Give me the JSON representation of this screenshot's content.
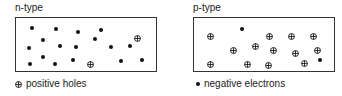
{
  "panels": [
    {
      "title": "n-type",
      "box": {
        "x": 15,
        "y": 17,
        "w": 142,
        "h": 55
      },
      "electrons": [
        [
          32,
          28
        ],
        [
          56,
          29
        ],
        [
          78,
          32
        ],
        [
          101,
          30
        ],
        [
          43,
          40
        ],
        [
          95,
          39
        ],
        [
          29,
          48
        ],
        [
          60,
          46
        ],
        [
          76,
          47
        ],
        [
          111,
          47
        ],
        [
          130,
          46
        ],
        [
          43,
          57
        ],
        [
          30,
          64
        ],
        [
          55,
          64
        ],
        [
          73,
          60
        ],
        [
          121,
          61
        ],
        [
          142,
          60
        ]
      ],
      "holes": [
        [
          137,
          31
        ],
        [
          90,
          57
        ]
      ]
    },
    {
      "title": "p-type",
      "box": {
        "x": 193,
        "y": 17,
        "w": 142,
        "h": 55
      },
      "electrons": [
        [
          242,
          29
        ],
        [
          320,
          60
        ]
      ],
      "holes": [
        [
          210,
          29
        ],
        [
          269,
          29
        ],
        [
          291,
          29
        ],
        [
          313,
          29
        ],
        [
          233,
          43
        ],
        [
          255,
          39
        ],
        [
          273,
          43
        ],
        [
          295,
          46
        ],
        [
          317,
          43
        ],
        [
          210,
          57
        ],
        [
          247,
          57
        ],
        [
          268,
          58
        ],
        [
          304,
          56
        ]
      ]
    }
  ],
  "legend": {
    "holes_label": "positive holes",
    "electrons_label": "negative electrons"
  },
  "colors": {
    "ink": "#111111",
    "border": "#333333"
  }
}
